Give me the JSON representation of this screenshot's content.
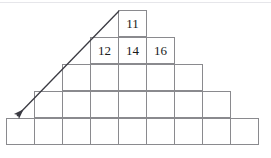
{
  "figure": {
    "kind": "number-pyramid-diagram",
    "colors": {
      "grid_line": "#8a8a8e",
      "text": "#1a1a1a",
      "arrow": "#3a3a42",
      "background": "#ffffff",
      "top_rule": "#e6e6ea"
    },
    "rows": [
      {
        "index": 1,
        "cell_count": 1,
        "left": 118,
        "top": 11,
        "cells": [
          {
            "value": "11"
          }
        ]
      },
      {
        "index": 2,
        "cell_count": 3,
        "left": 90,
        "top": 38,
        "cells": [
          {
            "value": "12"
          },
          {
            "value": "14"
          },
          {
            "value": "16"
          }
        ]
      },
      {
        "index": 3,
        "cell_count": 5,
        "left": 62,
        "top": 65,
        "cells": [
          {
            "value": ""
          },
          {
            "value": ""
          },
          {
            "value": ""
          },
          {
            "value": ""
          },
          {
            "value": ""
          }
        ]
      },
      {
        "index": 4,
        "cell_count": 7,
        "left": 34,
        "top": 92,
        "cells": [
          {
            "value": ""
          },
          {
            "value": ""
          },
          {
            "value": ""
          },
          {
            "value": ""
          },
          {
            "value": ""
          },
          {
            "value": ""
          },
          {
            "value": ""
          }
        ]
      },
      {
        "index": 5,
        "cell_count": 9,
        "left": 6,
        "top": 119,
        "cells": [
          {
            "value": ""
          },
          {
            "value": ""
          },
          {
            "value": ""
          },
          {
            "value": ""
          },
          {
            "value": ""
          },
          {
            "value": ""
          },
          {
            "value": ""
          },
          {
            "value": ""
          },
          {
            "value": ""
          }
        ]
      }
    ],
    "arrow": {
      "name": "diagonal-arrow",
      "direction": "down-left",
      "start_x": 119,
      "start_y": 11,
      "end_x": 17,
      "end_y": 116
    }
  }
}
